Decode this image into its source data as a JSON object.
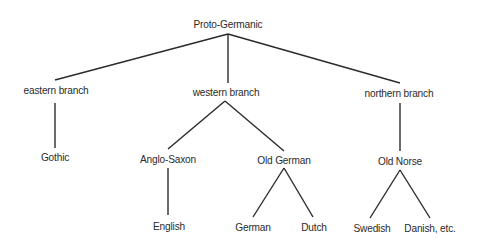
{
  "diagram": {
    "type": "tree",
    "line_color": "#2b2b2b",
    "nodes": {
      "root": {
        "label": "Proto-Germanic",
        "x": 228,
        "y": 24
      },
      "eastern": {
        "label": "eastern branch",
        "x": 56,
        "y": 90
      },
      "western": {
        "label": "western branch",
        "x": 226,
        "y": 92
      },
      "northern": {
        "label": "northern branch",
        "x": 399,
        "y": 93
      },
      "gothic": {
        "label": "Gothic",
        "x": 55,
        "y": 157
      },
      "anglo_saxon": {
        "label": "Anglo-Saxon",
        "x": 168,
        "y": 159
      },
      "old_german": {
        "label": "Old German",
        "x": 284,
        "y": 160
      },
      "old_norse": {
        "label": "Old Norse",
        "x": 400,
        "y": 161
      },
      "english": {
        "label": "English",
        "x": 169,
        "y": 226
      },
      "german": {
        "label": "German",
        "x": 253,
        "y": 227
      },
      "dutch": {
        "label": "Dutch",
        "x": 314,
        "y": 227
      },
      "swedish": {
        "label": "Swedish",
        "x": 372,
        "y": 228
      },
      "danish": {
        "label": "Danish, etc.",
        "x": 430,
        "y": 228
      }
    },
    "edges": [
      {
        "from": "root",
        "to": "eastern",
        "x1": 228,
        "y1": 34,
        "x2": 55,
        "y2": 80
      },
      {
        "from": "root",
        "to": "western",
        "x1": 228,
        "y1": 34,
        "x2": 228,
        "y2": 83
      },
      {
        "from": "root",
        "to": "northern",
        "x1": 228,
        "y1": 34,
        "x2": 400,
        "y2": 83
      },
      {
        "from": "eastern",
        "to": "gothic",
        "x1": 55,
        "y1": 103,
        "x2": 55,
        "y2": 148
      },
      {
        "from": "western",
        "to": "anglo_saxon",
        "x1": 225,
        "y1": 101,
        "x2": 168,
        "y2": 149
      },
      {
        "from": "western",
        "to": "old_german",
        "x1": 225,
        "y1": 101,
        "x2": 284,
        "y2": 151
      },
      {
        "from": "northern",
        "to": "old_norse",
        "x1": 400,
        "y1": 103,
        "x2": 400,
        "y2": 151
      },
      {
        "from": "anglo_saxon",
        "to": "english",
        "x1": 168,
        "y1": 168,
        "x2": 168,
        "y2": 215
      },
      {
        "from": "old_german",
        "to": "german",
        "x1": 284,
        "y1": 168,
        "x2": 253,
        "y2": 217
      },
      {
        "from": "old_german",
        "to": "dutch",
        "x1": 284,
        "y1": 168,
        "x2": 313,
        "y2": 217
      },
      {
        "from": "old_norse",
        "to": "swedish",
        "x1": 400,
        "y1": 170,
        "x2": 370,
        "y2": 218
      },
      {
        "from": "old_norse",
        "to": "danish",
        "x1": 400,
        "y1": 170,
        "x2": 430,
        "y2": 218
      }
    ]
  }
}
